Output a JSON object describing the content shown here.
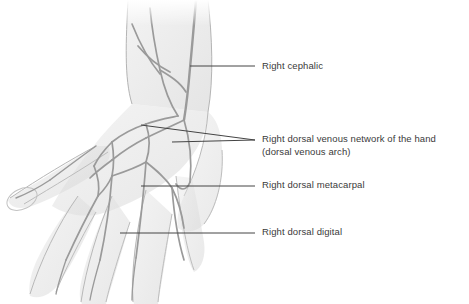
{
  "figure": {
    "style": "grayscale pencil anatomical illustration",
    "background_color": "#ffffff",
    "ink_color": "#3a3a3a",
    "vein_color": "#9a9a9a",
    "skin_shade": "#d8d8d8"
  },
  "labels": [
    {
      "id": "cephalic",
      "text": "Right cephalic",
      "leader": {
        "x1": 190,
        "y1": 66,
        "x2": 255,
        "y2": 66
      }
    },
    {
      "id": "network",
      "text": "Right dorsal venous network of the hand\n(dorsal venous arch)",
      "leader": {
        "x1": 141,
        "y1": 125,
        "x2": 255,
        "y2": 140
      },
      "leader2": {
        "x1": 172,
        "y1": 142,
        "x2": 255,
        "y2": 140
      }
    },
    {
      "id": "metacarpal",
      "text": "Right dorsal metacarpal",
      "leader": {
        "x1": 141,
        "y1": 186,
        "x2": 255,
        "y2": 186
      }
    },
    {
      "id": "digital",
      "text": "Right dorsal digital",
      "leader": {
        "x1": 120,
        "y1": 233,
        "x2": 255,
        "y2": 233
      }
    }
  ]
}
